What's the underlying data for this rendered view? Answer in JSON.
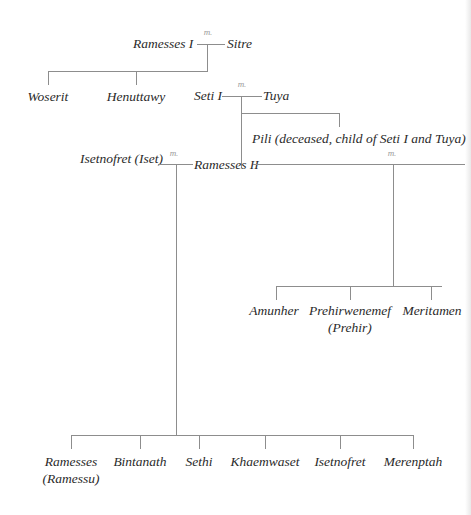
{
  "marriage_label": "m.",
  "generation1": {
    "husband": "Ramesses I",
    "wife": "Sitre",
    "children": [
      "Woserit",
      "Henuttawy",
      "Seti I"
    ]
  },
  "generation2": {
    "husband": "Seti I",
    "wife": "Tuya",
    "children": [
      "Ramesses II",
      "Pili (deceased, child of Seti I and Tuya)"
    ]
  },
  "generation3": {
    "ramesses": "Ramesses II",
    "wife1": "Isetnofret (Iset)",
    "wife1_children": [
      {
        "line1": "Ramesses",
        "line2": "(Ramessu)"
      },
      {
        "line1": "Bintanath",
        "line2": ""
      },
      {
        "line1": "Sethi",
        "line2": ""
      },
      {
        "line1": "Khaemwaset",
        "line2": ""
      },
      {
        "line1": "Isetnofret",
        "line2": ""
      },
      {
        "line1": "Merenptah",
        "line2": ""
      }
    ],
    "wife2_children": [
      {
        "line1": "Amunher",
        "line2": ""
      },
      {
        "line1": "Prehirwenemef",
        "line2": "(Prehir)"
      },
      {
        "line1": "Meritamen",
        "line2": ""
      }
    ]
  }
}
